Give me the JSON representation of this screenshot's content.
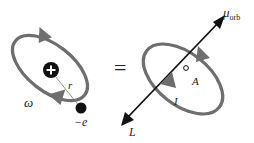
{
  "diagram": {
    "colors": {
      "orbit": "#6e6e6e",
      "arrow": "#6e6e6e",
      "axis": "#111111",
      "particle": "#111111",
      "background": "#ffffff"
    },
    "left": {
      "labels": {
        "omega": "ω",
        "radius": "r",
        "electron": "−e",
        "nucleus": "+"
      }
    },
    "equals": "=",
    "right": {
      "labels": {
        "mu": "μ",
        "mu_sub": "orb",
        "area": "A",
        "current": "I",
        "angular_momentum": "L"
      }
    }
  }
}
